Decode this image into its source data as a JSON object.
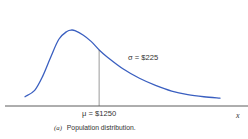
{
  "chart_data": {
    "type": "line",
    "title": "",
    "caption_label": "(a)",
    "caption_text": "Population distribution.",
    "xlabel": "x",
    "ylabel": "",
    "mean_label": "μ = $1250",
    "sd_label": "σ = $225",
    "mean": 1250,
    "sd": 225,
    "xlim": [
      700,
      2200
    ],
    "ylim": [
      0,
      1
    ],
    "grid": false,
    "legend": "none",
    "series": [
      {
        "name": "density",
        "color": "#3a5fc0",
        "x": [
          790,
          850,
          900,
          950,
          1000,
          1050,
          1080,
          1100,
          1150,
          1200,
          1250,
          1300,
          1400,
          1500,
          1600,
          1700,
          1800,
          1900,
          2000
        ],
        "y": [
          0.06,
          0.15,
          0.35,
          0.62,
          0.87,
          0.98,
          1.0,
          0.99,
          0.93,
          0.84,
          0.72,
          0.62,
          0.45,
          0.32,
          0.22,
          0.14,
          0.09,
          0.06,
          0.04
        ]
      }
    ],
    "mean_line_color": "#555555",
    "axis_color": "#333333"
  }
}
